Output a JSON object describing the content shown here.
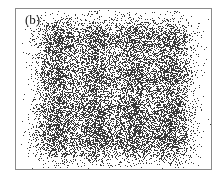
{
  "panel_label": "(b)",
  "colors": {
    "points": "#3a3a3a",
    "frame": "#8a8a8a",
    "background": "#ffffff"
  },
  "chart_data": {
    "type": "scatter",
    "title": "",
    "panel": "(b)",
    "xlabel": "",
    "ylabel": "",
    "grid": false,
    "legend": null,
    "cluster_grid": {
      "rows": 4,
      "cols": 4
    },
    "cluster_centers_px": {
      "x": [
        57,
        95,
        133,
        170
      ],
      "y": [
        40,
        75,
        110,
        140
      ]
    },
    "cluster_spread_px": 12,
    "points_per_cluster": 900
  }
}
